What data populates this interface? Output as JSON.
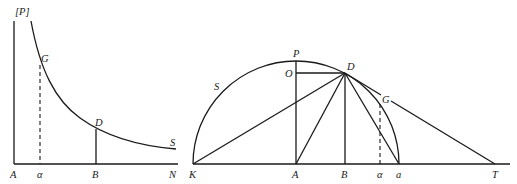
{
  "left_figure": {
    "labels": {
      "axis_top": "[P]",
      "origin": "A",
      "alpha": "α",
      "B": "B",
      "N": "N",
      "G": "G",
      "D": "D",
      "S": "S"
    }
  },
  "right_figure": {
    "labels": {
      "P": "P",
      "O": "O",
      "D": "D",
      "G": "G",
      "S": "S",
      "K": "K",
      "A": "A",
      "B": "B",
      "alpha": "α",
      "a": "a",
      "T": "T"
    }
  },
  "colors": {
    "ink": "#1a1a1a",
    "background": "#ffffff"
  }
}
